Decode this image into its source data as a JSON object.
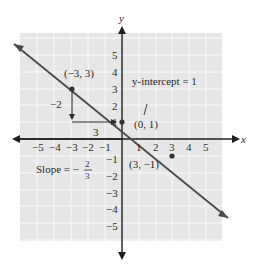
{
  "figure": {
    "axes": {
      "x_label": "x",
      "y_label": "y",
      "x_ticks": [
        "−5",
        "−4",
        "−3",
        "−2",
        "−1",
        "1",
        "2",
        "3",
        "4",
        "5"
      ],
      "y_ticks_pos": [
        "1",
        "2",
        "3",
        "4",
        "5"
      ],
      "y_ticks_neg": [
        "−1",
        "−2",
        "−3",
        "−4",
        "−5"
      ]
    },
    "points": {
      "p1": "(−3, 3)",
      "p2": "(0, 1)",
      "p3": "(3, −1)"
    },
    "annotations": {
      "rise": "−2",
      "run": "3",
      "y_intercept": "y-intercept = 1",
      "slope_prefix": "Slope = −",
      "slope_num": "2",
      "slope_den": "3"
    },
    "colors": {
      "grid_bg": "#e6e6e6",
      "grid_line": "#f8f8f8",
      "line": "#4a4a4a",
      "axis": "#1e1e1e"
    }
  }
}
